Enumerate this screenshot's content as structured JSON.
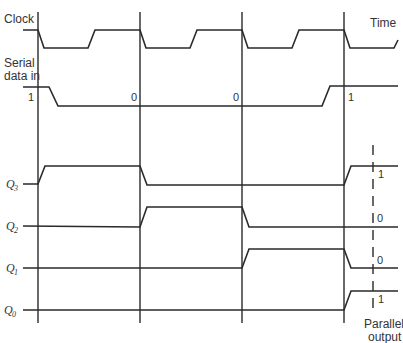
{
  "diagram": {
    "labels": {
      "clock": "Clock",
      "time": "Time",
      "serial_line1": "Serial",
      "serial_line2": "data in",
      "q3": "Q",
      "q3_sub": "3",
      "q2": "Q",
      "q2_sub": "2",
      "q1": "Q",
      "q1_sub": "1",
      "q0": "Q",
      "q0_sub": "0",
      "parallel_line1": "Parallel",
      "parallel_line2": "output"
    },
    "serial_values": [
      "1",
      "0",
      "0",
      "1"
    ],
    "parallel_output": {
      "q3": "1",
      "q2": "0",
      "q1": "0",
      "q0": "1"
    },
    "signals": [
      {
        "name": "Clock",
        "sequence": "1-0-1-0-1-0-1-0"
      },
      {
        "name": "Serial data in",
        "sequence": [
          "1",
          "0",
          "0",
          "1"
        ]
      },
      {
        "name": "Q3",
        "sequence": [
          "0",
          "1",
          "0",
          "0",
          "1"
        ]
      },
      {
        "name": "Q2",
        "sequence": [
          "0",
          "0",
          "1",
          "0",
          "0"
        ]
      },
      {
        "name": "Q1",
        "sequence": [
          "0",
          "0",
          "0",
          "1",
          "0"
        ]
      },
      {
        "name": "Q0",
        "sequence": [
          "0",
          "0",
          "0",
          "0",
          "1"
        ]
      }
    ],
    "colors": {
      "line": "#2a2a2a",
      "text": "#333333",
      "background": "#ffffff"
    }
  }
}
